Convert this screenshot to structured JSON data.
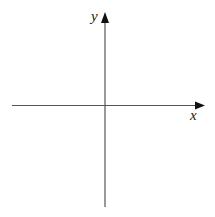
{
  "diagram": {
    "type": "cartesian-axes",
    "axes": {
      "x": {
        "label": "x",
        "direction": "right",
        "arrow": true
      },
      "y": {
        "label": "y",
        "direction": "up",
        "arrow": true
      }
    },
    "colors": {
      "axis": "#555555",
      "arrow": "#111111",
      "label": "#222222",
      "background": "#ffffff"
    }
  }
}
